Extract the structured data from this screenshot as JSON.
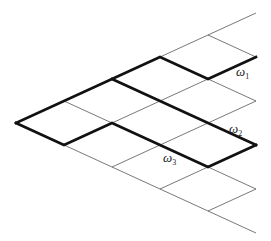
{
  "diagram": {
    "type": "lattice-paths",
    "origin": [
      16,
      123
    ],
    "u_step": [
      48,
      -22
    ],
    "v_step": [
      48,
      22
    ],
    "size": 5,
    "thick_paths": [
      {
        "name": "omega-1-path",
        "points": [
          [
            0,
            0
          ],
          [
            3,
            0
          ],
          [
            3,
            1
          ],
          [
            4,
            1
          ]
        ]
      },
      {
        "name": "omega-2-path",
        "points": [
          [
            2,
            0
          ],
          [
            2,
            3
          ]
        ]
      },
      {
        "name": "omega-3-path",
        "points": [
          [
            0,
            0
          ],
          [
            0,
            1
          ],
          [
            1,
            1
          ],
          [
            1,
            3
          ],
          [
            2,
            3
          ]
        ]
      }
    ],
    "labels": [
      {
        "name": "omega-1-label",
        "symbol": "ω",
        "sub": "1",
        "x": 236,
        "y": 65
      },
      {
        "name": "omega-2-label",
        "symbol": "ω",
        "sub": "2",
        "x": 229,
        "y": 122
      },
      {
        "name": "omega-3-label",
        "symbol": "ω",
        "sub": "3",
        "x": 163,
        "y": 151
      }
    ]
  }
}
